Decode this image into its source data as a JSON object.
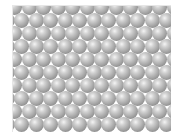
{
  "image": {
    "description": "Hexagonal close-packed lattice of grey shaded spheres",
    "lattice": {
      "rows": 10,
      "cols": 12,
      "pitch_x": 14.5,
      "pitch_y": 13,
      "diameter": 15,
      "offset_x": -6,
      "offset_y": -6
    },
    "colors": {
      "background": "#ffffff",
      "sphere_highlight": "#f4f4f4",
      "sphere_mid": "#a9a9a9",
      "sphere_shadow": "#767676"
    }
  }
}
